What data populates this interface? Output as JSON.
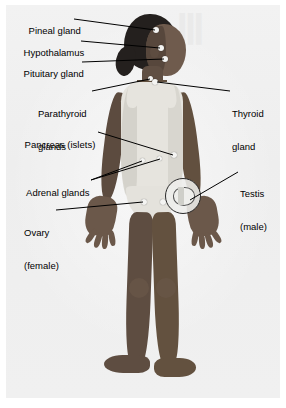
{
  "figure": {
    "subject_description": "Young child standing facing forward wearing a light sleeveless leotard",
    "background_color": "#f0f0f0",
    "text_color": "#000000",
    "leader_line_color": "#000000",
    "marker_color": "#f4f4f2"
  },
  "labels": [
    {
      "id": "pineal-gland",
      "text": "Pineal gland",
      "lines": [
        "Pineal gland"
      ],
      "side": "left",
      "x": 18,
      "y": 14
    },
    {
      "id": "hypothalamus",
      "text": "Hypothalamus",
      "lines": [
        "Hypothalamus"
      ],
      "side": "left",
      "x": 13,
      "y": 36
    },
    {
      "id": "pituitary-gland",
      "text": "Pituitary gland",
      "lines": [
        "Pituitary gland"
      ],
      "side": "left",
      "x": 13,
      "y": 57
    },
    {
      "id": "parathyroid-glands",
      "text": "Parathyroid glands",
      "lines": [
        "Parathyroid",
        "glands"
      ],
      "side": "left",
      "x": 38,
      "y": 86
    },
    {
      "id": "thyroid-gland",
      "text": "Thyroid gland",
      "lines": [
        "Thyroid",
        "gland"
      ],
      "side": "right",
      "x": 232,
      "y": 86
    },
    {
      "id": "pancreas-islets",
      "text": "Pancreas (islets)",
      "lines": [
        "Pancreas (islets)"
      ],
      "side": "left",
      "x": 14,
      "y": 128
    },
    {
      "id": "adrenal-glands",
      "text": "Adrenal glands",
      "lines": [
        "Adrenal glands"
      ],
      "side": "left",
      "x": 16,
      "y": 176
    },
    {
      "id": "testis-male",
      "text": "Testis (male)",
      "lines": [
        "Testis",
        "(male)"
      ],
      "side": "right",
      "x": 240,
      "y": 166
    },
    {
      "id": "ovary-female",
      "text": "Ovary (female)",
      "lines": [
        "Ovary",
        "(female)"
      ],
      "side": "left",
      "x": 24,
      "y": 205
    }
  ]
}
